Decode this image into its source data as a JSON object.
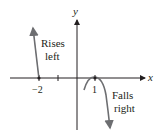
{
  "diagram": {
    "axes": {
      "x_label": "x",
      "y_label": "y"
    },
    "ticks": {
      "neg_two": "−2",
      "one": "1"
    },
    "annotations": {
      "left_line1": "Rises",
      "left_line2": "left",
      "right_line1": "Falls",
      "right_line2": "right"
    },
    "colors": {
      "axis": "#231f20",
      "curve": "#6d6e71",
      "text": "#231f20"
    }
  }
}
